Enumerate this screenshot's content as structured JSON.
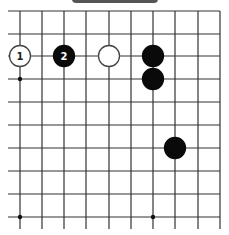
{
  "board": {
    "columns_x": [
      20,
      42,
      64,
      86,
      109,
      131,
      153,
      175,
      198,
      220
    ],
    "rows_y": [
      11,
      34,
      56,
      79,
      102,
      125,
      148,
      171,
      194,
      217
    ],
    "line_color": "#333333",
    "star_points": [
      [
        20,
        79
      ],
      [
        20,
        217
      ],
      [
        153,
        217
      ]
    ],
    "top_edge": true,
    "right_edge": true
  },
  "stones": [
    {
      "color": "white",
      "col": 0,
      "row": 2,
      "label": "1"
    },
    {
      "color": "black",
      "col": 2,
      "row": 2,
      "label": "2"
    },
    {
      "color": "white",
      "col": 4,
      "row": 2,
      "label": ""
    },
    {
      "color": "black",
      "col": 6,
      "row": 2,
      "label": ""
    },
    {
      "color": "black",
      "col": 6,
      "row": 3,
      "label": ""
    },
    {
      "color": "black",
      "col": 7,
      "row": 6,
      "label": ""
    }
  ]
}
